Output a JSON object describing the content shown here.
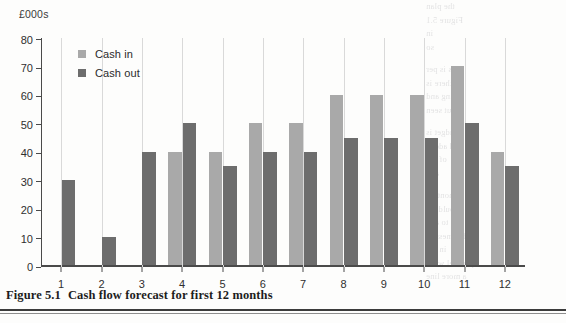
{
  "figure": {
    "caption_label": "Figure 5.1",
    "caption_text": "Cash flow forecast for first 12 months"
  },
  "colors": {
    "cash_in": "#a9a9a9",
    "cash_out": "#6d6d6d",
    "axis": "#4a4a4a",
    "gridline": "#d9d9d9"
  },
  "chart_data": {
    "type": "bar",
    "title": "Cash flow forecast for first 12 months",
    "xlabel": "",
    "ylabel": "£000s",
    "unit_label": "£000s",
    "categories": [
      "1",
      "2",
      "3",
      "4",
      "5",
      "6",
      "7",
      "8",
      "9",
      "10",
      "11",
      "12"
    ],
    "series": [
      {
        "name": "Cash in",
        "color": "#a9a9a9",
        "values": [
          0,
          0,
          0,
          40,
          40,
          50,
          50,
          60,
          60,
          60,
          70,
          40
        ]
      },
      {
        "name": "Cash out",
        "color": "#6d6d6d",
        "values": [
          30,
          10,
          40,
          50,
          35,
          40,
          40,
          45,
          45,
          45,
          50,
          35
        ]
      }
    ],
    "ylim": [
      0,
      80
    ],
    "yticks": [
      0,
      10,
      20,
      30,
      40,
      50,
      60,
      70,
      80
    ],
    "ytick_labels": [
      "0",
      "10",
      "20",
      "30",
      "40",
      "50",
      "60",
      "70",
      "80"
    ],
    "grid": "vertical",
    "legend_position": "top-left"
  },
  "bleed_text": [
    "the plan",
    "Figure 5.1",
    "in",
    "so",
    "as is per",
    "there is",
    "going and",
    "but seen",
    "budget is",
    "and added",
    "of the",
    "and",
    "monthly",
    "should try",
    "to and",
    "business to",
    "in the",
    "parallel work",
    "a more line"
  ]
}
